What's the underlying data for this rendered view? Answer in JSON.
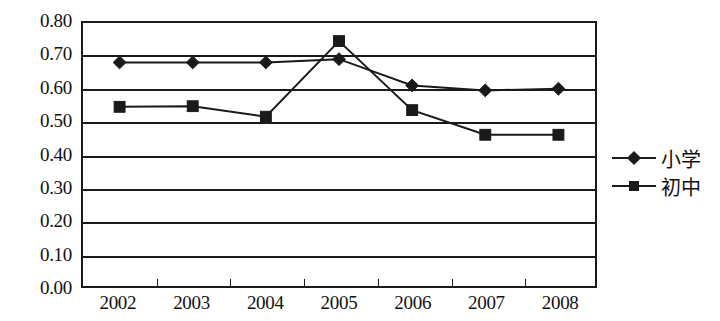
{
  "chart_data": {
    "type": "line",
    "title": "",
    "xlabel": "",
    "ylabel": "",
    "categories": [
      "2002",
      "2003",
      "2004",
      "2005",
      "2006",
      "2007",
      "2008"
    ],
    "series": [
      {
        "name": "小学",
        "marker": "diamond",
        "color": "#1a1a1a",
        "values": [
          0.68,
          0.68,
          0.68,
          0.69,
          0.61,
          0.595,
          0.6
        ]
      },
      {
        "name": "初中",
        "marker": "square",
        "color": "#1a1a1a",
        "values": [
          0.545,
          0.547,
          0.515,
          0.745,
          0.535,
          0.46,
          0.46
        ]
      }
    ],
    "ylim": [
      0.0,
      0.8
    ],
    "ytick_step": 0.1,
    "ytick_labels": [
      "0.80",
      "0.70",
      "0.60",
      "0.50",
      "0.40",
      "0.30",
      "0.20",
      "0.10",
      "0.00"
    ],
    "ytick_values": [
      0.8,
      0.7,
      0.6,
      0.5,
      0.4,
      0.3,
      0.2,
      0.1,
      0.0
    ],
    "grid": true,
    "grid_axis": "y",
    "legend_position": "right"
  },
  "legend": {
    "items": [
      {
        "label": "小学",
        "marker": "diamond-marker-icon"
      },
      {
        "label": "初中",
        "marker": "square-marker-icon"
      }
    ]
  }
}
